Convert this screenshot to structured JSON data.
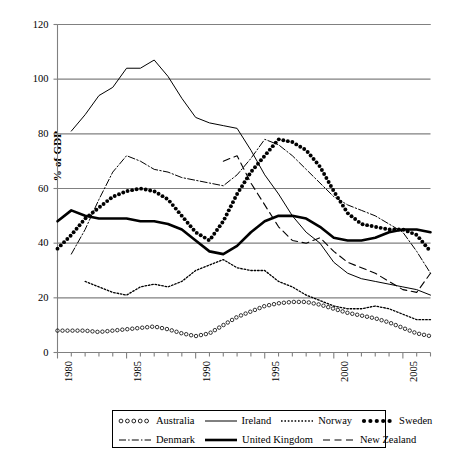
{
  "chart_data": {
    "type": "line",
    "title": "",
    "xlabel": "",
    "ylabel": "% of GDP",
    "xlim": [
      1980,
      2007
    ],
    "ylim": [
      0,
      120
    ],
    "ytick_values": [
      0,
      20,
      40,
      60,
      80,
      100,
      120
    ],
    "ytick_labels": [
      "0",
      "20",
      "40",
      "60",
      "80",
      "100",
      "120"
    ],
    "xtick_values": [
      1980,
      1985,
      1990,
      1995,
      2000,
      2005
    ],
    "xtick_labels": [
      "1980",
      "1985",
      "1990",
      "1995",
      "2000",
      "2005"
    ],
    "minor_xticks_every": 1,
    "grid": "horizontal",
    "legend_position": "below-axes",
    "series": [
      {
        "name": "Australia",
        "style": "open-circle-dots",
        "x": [
          1980,
          1981,
          1982,
          1983,
          1984,
          1985,
          1986,
          1987,
          1988,
          1989,
          1990,
          1991,
          1992,
          1993,
          1994,
          1995,
          1996,
          1997,
          1998,
          1999,
          2000,
          2001,
          2002,
          2003,
          2004,
          2005,
          2006,
          2007
        ],
        "values": [
          8,
          8,
          8,
          7.5,
          8,
          8.5,
          9,
          9.5,
          8.5,
          7,
          6,
          7,
          10,
          13,
          15,
          17,
          18,
          18.5,
          18.5,
          17.5,
          16,
          14.5,
          13.5,
          12.5,
          11,
          9,
          7,
          6
        ]
      },
      {
        "name": "Ireland",
        "style": "thin-solid",
        "x": [
          1981,
          1982,
          1983,
          1984,
          1985,
          1986,
          1987,
          1988,
          1989,
          1990,
          1991,
          1992,
          1993,
          1994,
          1995,
          1996,
          1997,
          1998,
          1999,
          2000,
          2001,
          2002,
          2003,
          2004,
          2005,
          2006,
          2007
        ],
        "values": [
          81,
          87,
          94,
          97,
          104,
          104,
          107,
          101,
          93,
          86,
          84,
          83,
          82,
          74,
          65,
          58,
          50,
          44,
          40,
          33,
          29,
          27,
          26,
          25,
          24,
          23,
          21
        ]
      },
      {
        "name": "Norway",
        "style": "fine-dotted",
        "x": [
          1982,
          1983,
          1984,
          1985,
          1986,
          1987,
          1988,
          1989,
          1990,
          1991,
          1992,
          1993,
          1994,
          1995,
          1996,
          1997,
          1998,
          1999,
          2000,
          2001,
          2002,
          2003,
          2004,
          2005,
          2006,
          2007
        ],
        "values": [
          26,
          24,
          22,
          21,
          24,
          25,
          24,
          26,
          30,
          32,
          34,
          31,
          30,
          30,
          26,
          24,
          21,
          19,
          17,
          16,
          16,
          17,
          16,
          14,
          12,
          12
        ]
      },
      {
        "name": "Sweden",
        "style": "thick-dotted",
        "x": [
          1980,
          1981,
          1982,
          1983,
          1984,
          1985,
          1986,
          1987,
          1988,
          1989,
          1990,
          1991,
          1992,
          1993,
          1994,
          1995,
          1996,
          1997,
          1998,
          1999,
          2000,
          2001,
          2002,
          2003,
          2004,
          2005,
          2006,
          2007
        ],
        "values": [
          38,
          43,
          49,
          53,
          57,
          59,
          60,
          59,
          56,
          50,
          44,
          41,
          48,
          58,
          66,
          72,
          78,
          77,
          74,
          68,
          59,
          51,
          47,
          46,
          45,
          45,
          43,
          37
        ]
      },
      {
        "name": "Denmark",
        "style": "dash-dot",
        "x": [
          1981,
          1982,
          1983,
          1984,
          1985,
          1986,
          1987,
          1988,
          1989,
          1990,
          1991,
          1992,
          1993,
          1994,
          1995,
          1996,
          1997,
          1998,
          1999,
          2000,
          2001,
          2002,
          2003,
          2004,
          2005,
          2006,
          2007
        ],
        "values": [
          36,
          45,
          56,
          66,
          72,
          70,
          67,
          66,
          64,
          63,
          62,
          61,
          65,
          71,
          78,
          76,
          72,
          67,
          62,
          57,
          54,
          52,
          50,
          47,
          44,
          37,
          29
        ]
      },
      {
        "name": "United Kingdom",
        "style": "thick-solid",
        "x": [
          1980,
          1981,
          1982,
          1983,
          1984,
          1985,
          1986,
          1987,
          1988,
          1989,
          1990,
          1991,
          1992,
          1993,
          1994,
          1995,
          1996,
          1997,
          1998,
          1999,
          2000,
          2001,
          2002,
          2003,
          2004,
          2005,
          2006,
          2007
        ],
        "values": [
          48,
          52,
          50,
          49,
          49,
          49,
          48,
          48,
          47,
          45,
          41,
          37,
          36,
          39,
          44,
          48,
          50,
          50,
          49,
          46,
          42,
          41,
          41,
          42,
          44,
          45,
          45,
          44
        ]
      },
      {
        "name": "New Zealand",
        "style": "dashed",
        "x": [
          1992,
          1993,
          1994,
          1995,
          1996,
          1997,
          1998,
          1999,
          2000,
          2001,
          2002,
          2003,
          2004,
          2005,
          2006,
          2007
        ],
        "values": [
          70,
          72,
          62,
          54,
          46,
          41,
          40,
          42,
          37,
          33,
          31,
          29,
          26,
          23,
          22,
          29
        ]
      }
    ]
  },
  "legend": {
    "rows": [
      [
        {
          "label": "Australia",
          "key": "open-circle-dots"
        },
        {
          "label": "Ireland",
          "key": "thin-solid"
        },
        {
          "label": "Norway",
          "key": "fine-dotted"
        },
        {
          "label": "Sweden",
          "key": "thick-dotted"
        }
      ],
      [
        {
          "label": "Denmark",
          "key": "dash-dot"
        },
        {
          "label": "United Kingdom",
          "key": "thick-solid"
        },
        {
          "label": "New Zealand",
          "key": "dashed"
        }
      ]
    ]
  },
  "colors": {
    "line": "#000000",
    "grid": "#808080",
    "axis": "#808080",
    "background": "#ffffff"
  }
}
